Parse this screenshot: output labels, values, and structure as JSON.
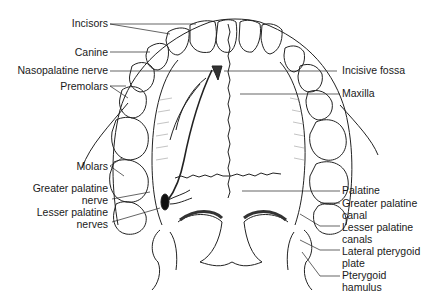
{
  "diagram": {
    "labels_left": [
      {
        "id": "incisors",
        "text": "Incisors"
      },
      {
        "id": "canine",
        "text": "Canine"
      },
      {
        "id": "nasopalatine-nerve",
        "text": "Nasopalatine nerve"
      },
      {
        "id": "premolars",
        "text": "Premolars"
      },
      {
        "id": "molars",
        "text": "Molars"
      },
      {
        "id": "greater-palatine-nerve",
        "line1": "Greater palatine",
        "line2": "nerve"
      },
      {
        "id": "lesser-palatine-nerves",
        "line1": "Lesser palatine",
        "line2": "nerves"
      }
    ],
    "labels_right": [
      {
        "id": "incisive-fossa",
        "text": "Incisive fossa"
      },
      {
        "id": "maxilla",
        "text": "Maxilla"
      },
      {
        "id": "palatine",
        "text": "Palatine"
      },
      {
        "id": "greater-palatine-canal",
        "line1": "Greater palatine",
        "line2": "canal"
      },
      {
        "id": "lesser-palatine-canals",
        "line1": "Lesser palatine",
        "line2": "canals"
      },
      {
        "id": "lateral-pterygoid-plate",
        "line1": "Lateral pterygoid",
        "line2": "plate"
      },
      {
        "id": "pterygoid-hamulus",
        "line1": "Pterygoid",
        "line2": "hamulus"
      }
    ],
    "colors": {
      "line": "#222222",
      "text": "#1a1a1a",
      "hatch": "#9a9a9a",
      "background": "#ffffff"
    }
  }
}
